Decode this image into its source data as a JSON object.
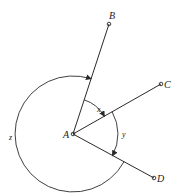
{
  "diagram": {
    "points": [
      {
        "id": "A",
        "label": "A",
        "x": 73,
        "y": 134
      },
      {
        "id": "B",
        "label": "B",
        "x": 109,
        "y": 24
      },
      {
        "id": "C",
        "label": "C",
        "x": 161,
        "y": 84
      },
      {
        "id": "D",
        "label": "D",
        "x": 154,
        "y": 178
      }
    ],
    "rays": [
      "AB",
      "AC",
      "AD"
    ],
    "angles": [
      {
        "label": "x",
        "between": "AB-AC"
      },
      {
        "label": "y",
        "between": "AC-AD"
      },
      {
        "label": "z",
        "between": "AD-AB (reflex)"
      }
    ],
    "stroke_color": "#2a2a2a"
  }
}
